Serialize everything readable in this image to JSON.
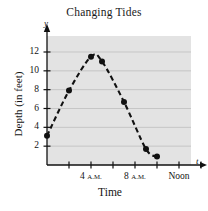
{
  "chart_data": {
    "type": "scatter",
    "title": "Changing Tides",
    "xlabel": "Time",
    "ylabel": "Depth (in feet)",
    "x_axis_variable": "t",
    "y_axis_variable": "y",
    "grid": true,
    "grid_orientation": "horizontal",
    "legend": null,
    "plot_background": "#e3e3e3",
    "curve_style": "dashed",
    "curve_color": "#111111",
    "point_color": "#111111",
    "xlim": [
      0,
      14
    ],
    "ylim": [
      0,
      13.5
    ],
    "x_unit": "hours after 12 A.M.",
    "x_ticks": [
      2,
      4,
      6,
      8,
      10,
      12,
      14
    ],
    "x_tick_labels": [
      "",
      "4 A.M.",
      "",
      "8 A.M.",
      "",
      "Noon",
      ""
    ],
    "y_ticks": [
      2,
      4,
      6,
      8,
      10,
      12
    ],
    "y_tick_labels": [
      "2",
      "4",
      "6",
      "8",
      "10",
      "12"
    ],
    "x": [
      0,
      2,
      4,
      5,
      7,
      9,
      10
    ],
    "values": [
      3.1,
      7.9,
      11.5,
      11.0,
      6.7,
      1.7,
      0.9
    ],
    "points": [
      {
        "x": 0,
        "y": 3.1
      },
      {
        "x": 2,
        "y": 7.9
      },
      {
        "x": 4,
        "y": 11.5
      },
      {
        "x": 5,
        "y": 11.0
      },
      {
        "x": 7,
        "y": 6.7
      },
      {
        "x": 9,
        "y": 1.7
      },
      {
        "x": 10,
        "y": 0.9
      }
    ]
  }
}
